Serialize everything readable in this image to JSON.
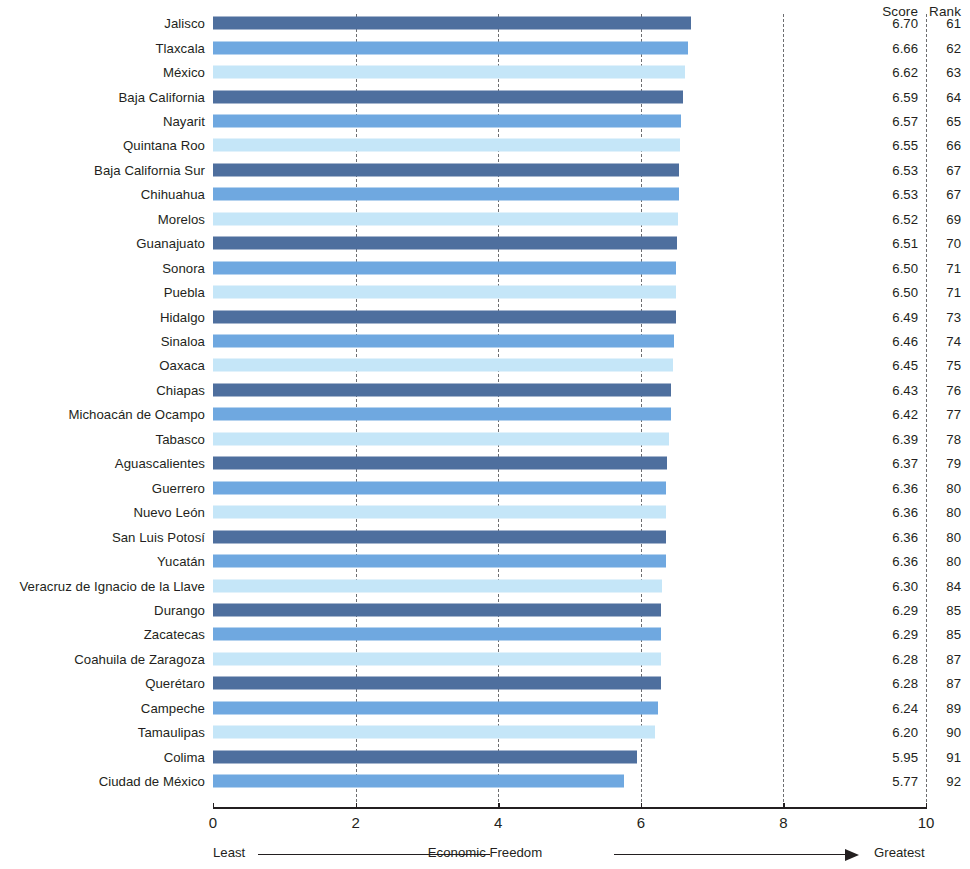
{
  "header": {
    "score_label": "Score",
    "rank_label": "Rank"
  },
  "axis": {
    "ticks": [
      "0",
      "2",
      "4",
      "6",
      "8",
      "10"
    ],
    "least_label": "Least",
    "title": "Economic Freedom",
    "greatest_label": "Greatest"
  },
  "chart_data": {
    "type": "bar",
    "orientation": "horizontal",
    "title": "",
    "xlabel": "Economic Freedom",
    "ylabel": "",
    "xlim": [
      0,
      10
    ],
    "xticks": [
      0,
      2,
      4,
      6,
      8,
      10
    ],
    "grid": true,
    "grid_style": "dashed vertical at each tick",
    "legend": "none",
    "axis_note_left": "Least",
    "axis_note_right": "Greatest",
    "value_columns": [
      "Score",
      "Rank"
    ],
    "palette": [
      "#4e6f9e",
      "#6fa8e0",
      "#c5e6f8"
    ],
    "categories": [
      "Jalisco",
      "Tlaxcala",
      "México",
      "Baja California",
      "Nayarit",
      "Quintana Roo",
      "Baja California Sur",
      "Chihuahua",
      "Morelos",
      "Guanajuato",
      "Sonora",
      "Puebla",
      "Hidalgo",
      "Sinaloa",
      "Oaxaca",
      "Chiapas",
      "Michoacán de Ocampo",
      "Tabasco",
      "Aguascalientes",
      "Guerrero",
      "Nuevo León",
      "San Luis Potosí",
      "Yucatán",
      "Veracruz de Ignacio de la Llave",
      "Durango",
      "Zacatecas",
      "Coahuila de Zaragoza",
      "Querétaro",
      "Campeche",
      "Tamaulipas",
      "Colima",
      "Ciudad de México"
    ],
    "values": [
      6.7,
      6.66,
      6.62,
      6.59,
      6.57,
      6.55,
      6.53,
      6.53,
      6.52,
      6.51,
      6.5,
      6.5,
      6.49,
      6.46,
      6.45,
      6.43,
      6.42,
      6.39,
      6.37,
      6.36,
      6.36,
      6.36,
      6.36,
      6.3,
      6.29,
      6.29,
      6.28,
      6.28,
      6.24,
      6.2,
      5.95,
      5.77
    ],
    "score_labels": [
      "6.70",
      "6.66",
      "6.62",
      "6.59",
      "6.57",
      "6.55",
      "6.53",
      "6.53",
      "6.52",
      "6.51",
      "6.50",
      "6.50",
      "6.49",
      "6.46",
      "6.45",
      "6.43",
      "6.42",
      "6.39",
      "6.37",
      "6.36",
      "6.36",
      "6.36",
      "6.36",
      "6.30",
      "6.29",
      "6.29",
      "6.28",
      "6.28",
      "6.24",
      "6.20",
      "5.95",
      "5.77"
    ],
    "ranks": [
      "61",
      "62",
      "63",
      "64",
      "65",
      "66",
      "67",
      "67",
      "69",
      "70",
      "71",
      "71",
      "73",
      "74",
      "75",
      "76",
      "77",
      "78",
      "79",
      "80",
      "80",
      "80",
      "80",
      "84",
      "85",
      "85",
      "87",
      "87",
      "89",
      "90",
      "91",
      "92"
    ]
  }
}
